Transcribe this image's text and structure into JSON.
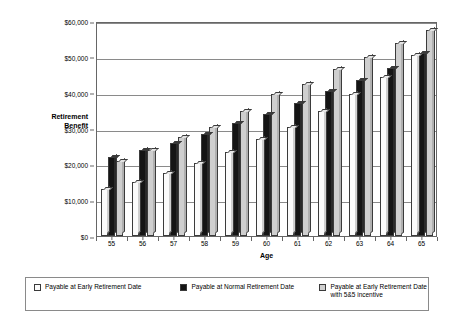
{
  "chart_data": {
    "type": "bar",
    "title": "",
    "xlabel": "Age",
    "ylabel": "Retirement\nBenefit",
    "ylabel_line1": "Retirement",
    "ylabel_line2": "Benefit",
    "categories": [
      "55",
      "56",
      "57",
      "58",
      "59",
      "60",
      "61",
      "62",
      "63",
      "64",
      "65"
    ],
    "ylim": [
      0,
      60000
    ],
    "ytick_labels": [
      "$0",
      "$10,000",
      "$20,000",
      "$30,000",
      "$40,000",
      "$50,000",
      "$60,000"
    ],
    "ytick_values": [
      0,
      10000,
      20000,
      30000,
      40000,
      50000,
      60000
    ],
    "grid": true,
    "legend_position": "bottom",
    "series": [
      {
        "name": "Payable at Early Retirement Date",
        "color": "#fbfbfb",
        "values": [
          13000,
          15000,
          17500,
          20500,
          23500,
          27000,
          30500,
          35000,
          39500,
          44500,
          50500
        ]
      },
      {
        "name": "Payable at Normal Retirement Date",
        "color": "#151515",
        "values": [
          22000,
          24000,
          26000,
          28500,
          31500,
          34000,
          37000,
          40500,
          43500,
          47000,
          51000
        ]
      },
      {
        "name": "Payable at Early Retirement Date with 5&5 incentive",
        "color": "#cfcfcf",
        "values": [
          21000,
          24000,
          27500,
          30500,
          35000,
          39500,
          42500,
          46500,
          50000,
          54000,
          57500
        ]
      }
    ]
  },
  "legend": {
    "items": [
      {
        "label": "Payable at Early Retirement Date"
      },
      {
        "label": "Payable at Normal Retirement Date"
      },
      {
        "label": "Payable at Early Retirement Date with 5&5 incentive"
      }
    ]
  }
}
